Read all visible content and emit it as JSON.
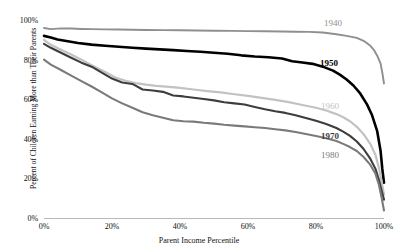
{
  "chart_data": {
    "type": "line",
    "title": "",
    "xlabel": "Parent Income Percentile",
    "ylabel": "Percent of Children Earning More than Their Parents",
    "xlim": [
      0,
      100
    ],
    "ylim": [
      0,
      100
    ],
    "grid": false,
    "legend_position": "inline-right",
    "x_ticks": [
      "0%",
      "20%",
      "40%",
      "60%",
      "80%",
      "100%"
    ],
    "x_tick_values": [
      0,
      20,
      40,
      60,
      80,
      100
    ],
    "y_ticks": [
      "0%",
      "20%",
      "40%",
      "60%",
      "80%",
      "100%"
    ],
    "y_tick_values": [
      0,
      20,
      40,
      60,
      80,
      100
    ],
    "series": [
      {
        "name": "1940",
        "color": "#8f8f8f",
        "width": 1.9,
        "bold_label": false,
        "label_x": 324,
        "label_y": 18,
        "x": [
          0,
          2,
          5,
          8,
          11,
          14,
          18,
          22,
          26,
          30,
          35,
          40,
          45,
          50,
          55,
          60,
          65,
          70,
          74,
          78,
          82,
          86,
          89,
          92,
          94,
          96,
          97,
          98,
          99,
          99.5,
          100
        ],
        "values": [
          96,
          95.4,
          95.8,
          95.7,
          95.5,
          95.4,
          95.3,
          95.2,
          95.1,
          95.0,
          94.9,
          94.8,
          94.7,
          94.6,
          94.5,
          94.4,
          94.3,
          94.2,
          94.1,
          94.0,
          93.7,
          92.8,
          92.0,
          91.0,
          89.5,
          87.0,
          85.0,
          82.0,
          78.0,
          73.5,
          68.0
        ]
      },
      {
        "name": "1950",
        "color": "#000000",
        "width": 2.6,
        "bold_label": true,
        "label_x": 320,
        "label_y": 58,
        "x": [
          0,
          2,
          4,
          7,
          10,
          14,
          18,
          22,
          26,
          30,
          34,
          38,
          42,
          46,
          50,
          54,
          58,
          62,
          66,
          70,
          73,
          76,
          79,
          82,
          85,
          87,
          89,
          91,
          93,
          95,
          96.5,
          98,
          99,
          99.5,
          100
        ],
        "values": [
          92,
          91.2,
          90.2,
          89.3,
          88.4,
          87.6,
          87.0,
          86.5,
          86.0,
          85.6,
          85.2,
          84.8,
          84.4,
          84.0,
          83.5,
          83.0,
          82.2,
          81.6,
          81.2,
          80.6,
          79.2,
          78.6,
          77.9,
          76.5,
          74.5,
          72.5,
          70.0,
          67.0,
          63.0,
          57.5,
          52.0,
          44.0,
          34.0,
          25.0,
          18.0
        ]
      },
      {
        "name": "1960",
        "color": "#c2c2c2",
        "width": 2.2,
        "bold_label": false,
        "label_x": 321,
        "label_y": 101,
        "x": [
          0,
          2,
          5,
          8,
          11,
          14,
          18,
          21,
          24,
          27,
          30,
          33,
          36,
          40,
          44,
          48,
          52,
          56,
          60,
          64,
          68,
          72,
          76,
          80,
          83,
          86,
          88,
          90,
          92,
          94,
          96,
          97.5,
          98.5,
          99.3,
          100
        ],
        "values": [
          90,
          87.5,
          85.0,
          82.6,
          80.0,
          77.2,
          73.8,
          71.0,
          69.4,
          68.2,
          67.4,
          66.8,
          66.4,
          65.8,
          65.0,
          64.2,
          63.5,
          62.6,
          61.8,
          60.8,
          59.8,
          58.6,
          57.2,
          55.8,
          54.4,
          52.6,
          51.0,
          49.0,
          46.2,
          42.5,
          37.5,
          32.0,
          25.5,
          18.5,
          12.0
        ]
      },
      {
        "name": "1970",
        "color": "#3d3d3d",
        "width": 2.1,
        "bold_label": true,
        "label_x": 321,
        "label_y": 131,
        "x": [
          0,
          2,
          5,
          8,
          11,
          14,
          17,
          20,
          23,
          26,
          29,
          32,
          35,
          38,
          41,
          44,
          47,
          50,
          53,
          56,
          59,
          62,
          65,
          68,
          71,
          74,
          77,
          80,
          83,
          86,
          88,
          90,
          92,
          94,
          96,
          97.5,
          98.5,
          99.3,
          100
        ],
        "values": [
          88,
          86.0,
          83.5,
          81.0,
          78.5,
          76.5,
          73.5,
          70.5,
          68.5,
          67.8,
          65.0,
          64.5,
          63.8,
          62.0,
          61.5,
          60.8,
          60.2,
          59.5,
          58.6,
          58.0,
          57.4,
          56.2,
          55.0,
          54.0,
          53.2,
          52.0,
          50.6,
          49.2,
          47.6,
          45.6,
          43.8,
          41.6,
          38.8,
          35.0,
          30.0,
          25.0,
          19.5,
          14.0,
          9.5
        ]
      },
      {
        "name": "1980",
        "color": "#7a7a7a",
        "width": 2.1,
        "bold_label": false,
        "label_x": 321,
        "label_y": 150,
        "x": [
          0,
          2,
          5,
          8,
          11,
          14,
          17,
          20,
          23,
          26,
          29,
          32,
          35,
          38,
          41,
          44,
          47,
          50,
          53,
          56,
          59,
          62,
          65,
          68,
          71,
          74,
          77,
          80,
          83,
          86,
          88,
          90,
          92,
          94,
          96,
          97.5,
          98.5,
          99.3,
          100
        ],
        "values": [
          80,
          77.5,
          74.8,
          72.0,
          69.2,
          66.5,
          63.5,
          60.5,
          58.0,
          55.8,
          53.5,
          52.0,
          50.8,
          49.5,
          49.0,
          48.8,
          48.2,
          47.8,
          47.2,
          46.8,
          46.4,
          46.0,
          45.6,
          45.0,
          44.4,
          43.6,
          42.6,
          41.6,
          40.4,
          39.0,
          37.6,
          36.0,
          34.0,
          31.0,
          27.0,
          22.5,
          17.0,
          10.5,
          4.0
        ]
      }
    ]
  },
  "axes": {
    "x_title": "Parent Income Percentile",
    "y_title": "Percent of Children Earning More than Their Parents",
    "x_tick_labels": [
      "0%",
      "20%",
      "40%",
      "60%",
      "80%",
      "100%"
    ],
    "y_tick_labels": [
      "100%",
      "80%",
      "60%",
      "40%",
      "20%",
      "0%"
    ]
  }
}
